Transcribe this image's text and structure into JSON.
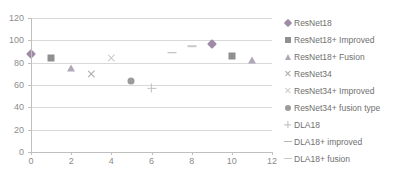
{
  "chart_data": {
    "type": "scatter",
    "title": "",
    "xlabel": "",
    "ylabel": "",
    "xlim": [
      0,
      12
    ],
    "ylim": [
      0,
      120
    ],
    "xticks": [
      0,
      2,
      4,
      6,
      8,
      10,
      12
    ],
    "yticks": [
      0,
      20,
      40,
      60,
      80,
      100,
      120
    ],
    "grid": "horizontal",
    "legend_position": "right",
    "series": [
      {
        "name": "ResNet18",
        "marker": "diamond",
        "color": "#9e8ca6",
        "points": [
          {
            "x": 0,
            "y": 88
          },
          {
            "x": 9,
            "y": 97
          }
        ]
      },
      {
        "name": "ResNet18+ Improved",
        "marker": "square",
        "color": "#8f8f8f",
        "points": [
          {
            "x": 1,
            "y": 84
          },
          {
            "x": 10,
            "y": 86
          }
        ]
      },
      {
        "name": "ResNet18+ Fusion",
        "marker": "triangle",
        "color": "#b0a8b8",
        "points": [
          {
            "x": 2,
            "y": 75
          },
          {
            "x": 11,
            "y": 82
          }
        ]
      },
      {
        "name": "ResNet34",
        "marker": "cross",
        "color": "#a9a9a9",
        "points": [
          {
            "x": 3,
            "y": 70
          }
        ]
      },
      {
        "name": "ResNet34+ Improved",
        "marker": "cross-light",
        "color": "#c9c9c9",
        "points": [
          {
            "x": 4,
            "y": 84
          }
        ]
      },
      {
        "name": "ResNet34+ fusion type",
        "marker": "circle",
        "color": "#9b9b9b",
        "points": [
          {
            "x": 5,
            "y": 64
          }
        ]
      },
      {
        "name": "DLA18",
        "marker": "plus",
        "color": "#c0c0c0",
        "points": [
          {
            "x": 6,
            "y": 57
          }
        ]
      },
      {
        "name": "DLA18+ improved",
        "marker": "dash",
        "color": "#b5b5b5",
        "points": [
          {
            "x": 7,
            "y": 89
          }
        ]
      },
      {
        "name": "DLA18+ fusion",
        "marker": "dash-light",
        "color": "#c9c9c9",
        "points": [
          {
            "x": 8,
            "y": 95
          }
        ]
      }
    ]
  },
  "axes": {
    "y_tick_labels": [
      "120",
      "100",
      "80",
      "60",
      "40",
      "20",
      "0"
    ],
    "x_tick_labels": [
      "0",
      "2",
      "4",
      "6",
      "8",
      "10",
      "12"
    ]
  },
  "legend": {
    "items": [
      {
        "label": "ResNet18",
        "key": "diamond"
      },
      {
        "label": "ResNet18+ Improved",
        "key": "square"
      },
      {
        "label": "ResNet18+ Fusion",
        "key": "triangle"
      },
      {
        "label": "ResNet34",
        "key": "cross"
      },
      {
        "label": "ResNet34+ Improved",
        "key": "cross-light"
      },
      {
        "label": "ResNet34+ fusion type",
        "key": "circle"
      },
      {
        "label": "DLA18",
        "key": "plus"
      },
      {
        "label": "DLA18+ improved",
        "key": "dash"
      },
      {
        "label": "DLA18+ fusion",
        "key": "dash-light"
      }
    ]
  }
}
